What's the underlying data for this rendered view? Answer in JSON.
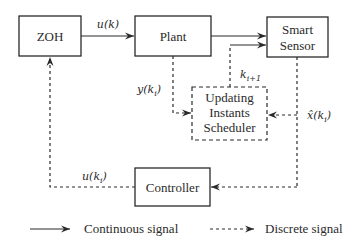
{
  "diagram": {
    "blocks": {
      "zoh": {
        "label": "ZOH"
      },
      "plant": {
        "label": "Plant"
      },
      "smart_sensor": {
        "line1": "Smart",
        "line2": "Sensor"
      },
      "scheduler": {
        "line1": "Updating",
        "line2": "Instants",
        "line3": "Scheduler"
      },
      "controller": {
        "label": "Controller"
      }
    },
    "signals": {
      "u_k": "u(k)",
      "y_ki": "y(k",
      "y_ki_sub": "i",
      "y_ki_close": ")",
      "k_next": "k",
      "k_next_sub": "i+1",
      "xhat_ki": "x̂(k",
      "xhat_ki_sub": "i",
      "xhat_ki_close": ")",
      "u_ki": "u(k",
      "u_ki_sub": "i",
      "u_ki_close": ")"
    },
    "legend": {
      "continuous": "Continuous signal",
      "discrete": "Discrete signal"
    },
    "colors": {
      "stroke": "#2a2a2a",
      "background": "#ffffff"
    }
  }
}
